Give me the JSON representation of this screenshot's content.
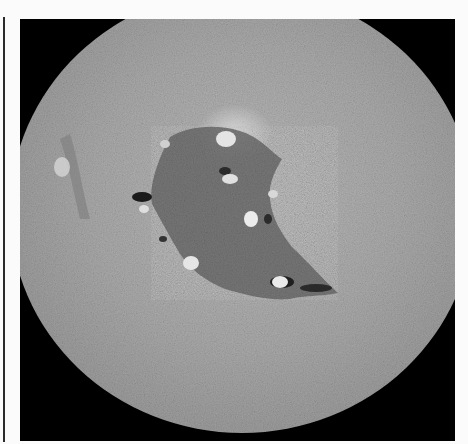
{
  "figure": {
    "kind": "grayscale micrograph",
    "field_of_view": "circular",
    "background_color": "#000000",
    "specimen_base_color": "#a8a8a8",
    "defect_region_color": "#6e6e6e",
    "pit_highlight_color": "#e4e4e4",
    "page_color": "#fbfbfb",
    "rule_color": "#2a2a2a"
  }
}
